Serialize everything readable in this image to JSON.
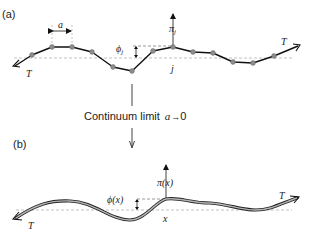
{
  "panel_a": {
    "label": "(a)",
    "spacing_label": "a",
    "tension_left": "T",
    "tension_right": "T",
    "phi_label": "ϕ",
    "phi_sub": "j",
    "pi_label": "π",
    "pi_sub": "j",
    "site_label": "j",
    "beads": [
      [
        32,
        55
      ],
      [
        52,
        47
      ],
      [
        72,
        47
      ],
      [
        92,
        52
      ],
      [
        113,
        67
      ],
      [
        132,
        71
      ],
      [
        153,
        51
      ],
      [
        173,
        47
      ],
      [
        193,
        52
      ],
      [
        213,
        53
      ],
      [
        233,
        62
      ],
      [
        253,
        63
      ],
      [
        274,
        56
      ]
    ]
  },
  "transition": {
    "text": "Continuum limit",
    "var": "a",
    "arrow": "→",
    "limit": "0"
  },
  "panel_b": {
    "label": "(b)",
    "tension_left": "T",
    "tension_right": "T",
    "phi_label": "ϕ(x)",
    "pi_label": "π(x)",
    "site_label": "x"
  },
  "colors": {
    "line": "#111111",
    "bead": "#9a9a9a",
    "dashed": "#9a9a9a",
    "string_fill": "#b0b0b0"
  }
}
